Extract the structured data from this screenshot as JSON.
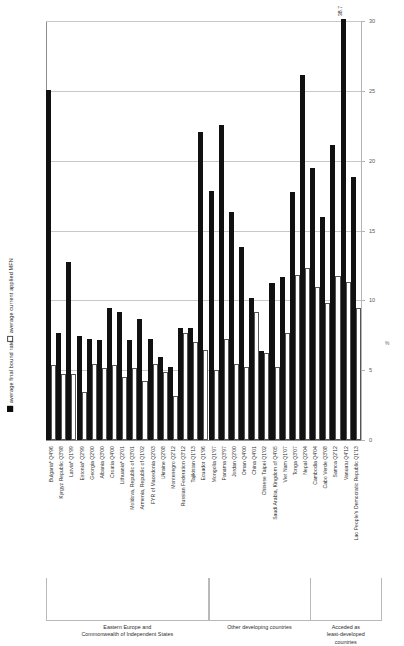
{
  "legend": {
    "bound": "average final bound rate",
    "applied": "average current applied MFN"
  },
  "axis": {
    "y_ticks": [
      "0",
      "5",
      "10",
      "15",
      "20",
      "25",
      "30"
    ],
    "unit": "%"
  },
  "groups": [
    {
      "id": "eeca",
      "label": "Eastern Europe and\nCommonwealth of Independent States",
      "count": 16
    },
    {
      "id": "other",
      "label": "Other developing countries",
      "count": 10
    },
    {
      "id": "ldc",
      "label": "Acceded as\nleast-developed\ncountries",
      "count": 7
    }
  ],
  "chart_data": {
    "type": "bar",
    "title": "",
    "xlabel": "",
    "ylabel": "%",
    "ylim": [
      0,
      30
    ],
    "yticks": [
      0,
      5,
      10,
      15,
      20,
      25,
      30
    ],
    "grid": true,
    "legend_position": "left-vertical",
    "categories": [
      "Bulgaria* Q4'96",
      "Kyrgyz Republic Q3'98",
      "Latvia* Q1'99",
      "Estonia* Q2'99",
      "Georgia Q2'00",
      "Albania Q3'00",
      "Croatia Q4'00",
      "Lithuania* Q2'01",
      "Moldova, Republic of Q3'01",
      "Armenia, Republic of Q1'02",
      "FYR of Macedonia Q2'03",
      "Ukraine Q2'08",
      "Montenegro Q2'12",
      "Russian Federation Q3'12",
      "Tajikistan Q1'13",
      "Ecuador Q1'96",
      "Mongolia Q1'97",
      "Panama Q3'97",
      "Jordan Q2'00",
      "Oman Q4'00",
      "China Q4'01",
      "Chinese Taipei Q1'02",
      "Saudi Arabia, Kingdom of Q4'05",
      "Viet Nam Q1'07",
      "Tonga Q3'07",
      "Nepal Q2'04",
      "Cambodia Q4'04",
      "Cabo Verde Q3'08",
      "Samoa Q2'12",
      "Vanuatu Q4'12",
      "Lao People's Democratic Republic Q1'13"
    ],
    "series": [
      {
        "name": "average final bound rate",
        "color": "#111111",
        "values": [
          24.9,
          7.5,
          12.6,
          7.3,
          7.1,
          7.0,
          9.3,
          9.0,
          7.0,
          8.5,
          7.1,
          5.8,
          5.1,
          7.9,
          7.9,
          21.9,
          17.7,
          22.4,
          16.2,
          13.7,
          10.0,
          6.2,
          11.1,
          11.5,
          17.6,
          26.0,
          19.3,
          15.8,
          21.0,
          38.7,
          18.7
        ]
      },
      {
        "name": "average current applied MFN",
        "color": "#ffffff",
        "values": [
          5.2,
          4.6,
          4.6,
          3.3,
          5.3,
          5.0,
          5.2,
          4.4,
          5.0,
          4.1,
          5.3,
          4.7,
          3.0,
          7.5,
          6.9,
          6.3,
          4.9,
          7.1,
          5.3,
          5.1,
          9.0,
          6.1,
          5.1,
          7.5,
          11.7,
          12.2,
          10.8,
          9.7,
          11.6,
          11.2,
          9.3
        ]
      }
    ],
    "annotations": [
      {
        "category": "Vanuatu Q4'12",
        "series": "average final bound rate",
        "text": "38.7"
      }
    ]
  }
}
